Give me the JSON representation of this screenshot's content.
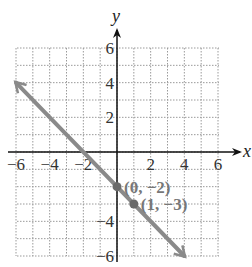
{
  "chart_data": {
    "type": "line",
    "title": "",
    "xlabel": "x",
    "ylabel": "y",
    "xlim": [
      -6,
      6
    ],
    "ylim": [
      -6,
      6
    ],
    "grid": true,
    "x_ticks": [
      -6,
      -4,
      -2,
      2,
      4,
      6
    ],
    "y_ticks": [
      6,
      4,
      2,
      -4,
      -6
    ],
    "x_tick_labels": [
      "−6",
      "−4",
      "−2",
      "2",
      "4",
      "6"
    ],
    "y_tick_labels": [
      "6",
      "4",
      "2",
      "−4",
      "−6"
    ],
    "series": [
      {
        "name": "y = -x - 2",
        "x": [
          -6,
          4
        ],
        "y": [
          4,
          -6
        ],
        "arrows": "both",
        "color": "#8a8a8a"
      }
    ],
    "points": [
      {
        "x": 0,
        "y": -2,
        "label": "(0, −2)"
      },
      {
        "x": 1,
        "y": -3,
        "label": "(1, −3)"
      }
    ]
  },
  "colors": {
    "grid": "#9a9a9a",
    "axis": "#111111",
    "line": "#8a8a8a",
    "point": "#6a6a6a"
  }
}
